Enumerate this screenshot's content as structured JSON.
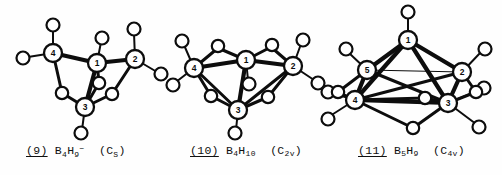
{
  "figure": {
    "background_color": "#fefefe",
    "ink_color": "#0d0d0d",
    "kind": "borane-cluster-structure-diagrams",
    "count": 3
  },
  "structures": [
    {
      "id": "struct-9",
      "number": "(9)",
      "number_plain": "9",
      "formula_prefix": "B",
      "formula_b_sub": "4",
      "formula_h": "H",
      "formula_h_sub": "9",
      "charge": "−",
      "symmetry_open": "(C",
      "symmetry_sub": "S",
      "symmetry_close": ")",
      "caption_full": "(9) B4H9- (CS)",
      "boron_labels": [
        "1",
        "2",
        "3",
        "4"
      ],
      "boron_count": 4,
      "terminal_h_count": 5,
      "bridge_h_count": 4
    },
    {
      "id": "struct-10",
      "number": "(10)",
      "number_plain": "10",
      "formula_prefix": "B",
      "formula_b_sub": "4",
      "formula_h": "H",
      "formula_h_sub": "10",
      "charge": "",
      "symmetry_open": "(C",
      "symmetry_sub": "2v",
      "symmetry_close": ")",
      "caption_full": "(10) B4H10 (C2v)",
      "boron_labels": [
        "1",
        "2",
        "3",
        "4"
      ],
      "boron_count": 4,
      "terminal_h_count": 6,
      "bridge_h_count": 4
    },
    {
      "id": "struct-11",
      "number": "(11)",
      "number_plain": "11",
      "formula_prefix": "B",
      "formula_b_sub": "5",
      "formula_h": "H",
      "formula_h_sub": "9",
      "charge": "",
      "symmetry_open": "(C",
      "symmetry_sub": "4v",
      "symmetry_close": ")",
      "caption_full": "(11) B5H9 (C4v)",
      "boron_labels": [
        "1",
        "2",
        "3",
        "4",
        "5"
      ],
      "boron_count": 5,
      "terminal_h_count": 5,
      "bridge_h_count": 4
    }
  ]
}
